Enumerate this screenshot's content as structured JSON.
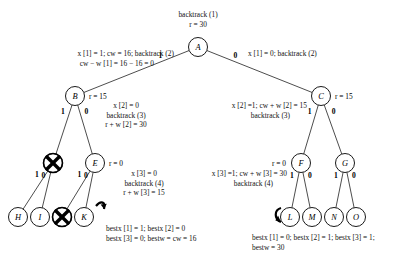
{
  "figure": {
    "title_top": "backtrack (1)",
    "root_r": "r = 30",
    "type": "state-space-backtracking-tree"
  },
  "nodes": [
    {
      "id": "A",
      "letter": "A",
      "x": 198,
      "y": 47,
      "r": 9.5,
      "crossed": false,
      "r_label": ""
    },
    {
      "id": "B",
      "letter": "B",
      "x": 75,
      "y": 96,
      "r": 9.5,
      "crossed": false,
      "r_label": "r = 15"
    },
    {
      "id": "C",
      "letter": "C",
      "x": 321,
      "y": 96,
      "r": 9.5,
      "crossed": false,
      "r_label": "r = 15"
    },
    {
      "id": "D",
      "letter": "",
      "x": 53,
      "y": 163,
      "r": 9.5,
      "crossed": true,
      "r_label": ""
    },
    {
      "id": "E",
      "letter": "E",
      "x": 95,
      "y": 163,
      "r": 9.5,
      "crossed": false,
      "r_label": "r = 0"
    },
    {
      "id": "F",
      "letter": "F",
      "x": 301,
      "y": 163,
      "r": 9.5,
      "crossed": false,
      "r_label": "r = 0"
    },
    {
      "id": "G",
      "letter": "G",
      "x": 345,
      "y": 163,
      "r": 9.5,
      "crossed": false,
      "r_label": ""
    },
    {
      "id": "H",
      "letter": "H",
      "x": 18,
      "y": 217,
      "r": 9.5,
      "crossed": false,
      "r_label": ""
    },
    {
      "id": "I",
      "letter": "I",
      "x": 40,
      "y": 217,
      "r": 9.5,
      "crossed": false,
      "r_label": ""
    },
    {
      "id": "J",
      "letter": "",
      "x": 62,
      "y": 217,
      "r": 9.5,
      "crossed": true,
      "r_label": ""
    },
    {
      "id": "K",
      "letter": "K",
      "x": 84,
      "y": 217,
      "r": 9.5,
      "crossed": false,
      "r_label": ""
    },
    {
      "id": "L",
      "letter": "L",
      "x": 290,
      "y": 217,
      "r": 9.5,
      "crossed": false,
      "r_label": ""
    },
    {
      "id": "M",
      "letter": "M",
      "x": 312,
      "y": 217,
      "r": 9.5,
      "crossed": false,
      "r_label": ""
    },
    {
      "id": "N",
      "letter": "N",
      "x": 334,
      "y": 217,
      "r": 9.5,
      "crossed": false,
      "r_label": ""
    },
    {
      "id": "O",
      "letter": "O",
      "x": 356,
      "y": 217,
      "r": 9.5,
      "crossed": false,
      "r_label": ""
    }
  ],
  "edges": [
    {
      "from": "A",
      "to": "B",
      "label": "1"
    },
    {
      "from": "A",
      "to": "C",
      "label": "0"
    },
    {
      "from": "B",
      "to": "D",
      "label": "1"
    },
    {
      "from": "B",
      "to": "E",
      "label": "0"
    },
    {
      "from": "C",
      "to": "F",
      "label": "1"
    },
    {
      "from": "C",
      "to": "G",
      "label": "0"
    },
    {
      "from": "D",
      "to": "H",
      "label": "1"
    },
    {
      "from": "D",
      "to": "I",
      "label": "0"
    },
    {
      "from": "E",
      "to": "J",
      "label": "1"
    },
    {
      "from": "E",
      "to": "K",
      "label": "0"
    },
    {
      "from": "F",
      "to": "L",
      "label": "1"
    },
    {
      "from": "F",
      "to": "M",
      "label": "0"
    },
    {
      "from": "G",
      "to": "N",
      "label": "1"
    },
    {
      "from": "G",
      "to": "O",
      "label": "0"
    }
  ],
  "annotations": {
    "root_title": "backtrack (1)",
    "root_r": "r = 30",
    "left_level1_line1": "x [1] = 1; cw = 16; backtrack (2)",
    "left_level1_line2": "cw − w [1] = 16 − 16 = 0",
    "right_level1": "x [1] = 0; backtrack (2)",
    "b_r": "r = 15",
    "c_r": "r = 15",
    "mid_level2_line1": "x [2] = 0",
    "mid_level2_line2": "backtrack (3)",
    "mid_level2_line3": "r + w [2] = 30",
    "right_level2_line1": "x [2] =1; cw + w [2] = 15",
    "right_level2_line2": "backtrack (3)",
    "e_r": "r = 0",
    "f_r": "r = 0",
    "mid_level3_line1": "x [3] = 0",
    "mid_level3_line2": "backtrack (4)",
    "mid_level3_line3": "r + w [3] = 15",
    "right_level3_line1": "x [3] =1; cw + w [3] = 30",
    "right_level3_line2": "backtrack (4)",
    "bottom_left_line1": "bestx [1] = 1; bestx [2] = 0",
    "bottom_left_line2": "bestx [3] = 0; bestw = cw = 16",
    "bottom_right_line1": "bestx [1] = 0; bestx [2] = 1; bestx [3] = 1;",
    "bottom_right_line2": "bestw = 30"
  }
}
